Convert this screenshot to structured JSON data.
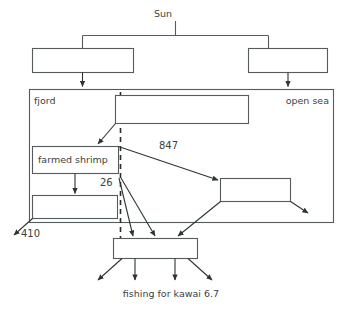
{
  "diagram": {
    "title": "Sun",
    "regions": {
      "left_label": "fjord",
      "right_label": "open sea"
    },
    "nodes": {
      "sun": "Sun",
      "top_left_box": "",
      "top_right_box": "",
      "upper_wide_box": "",
      "farmed_shrimp": "farmed shrimp",
      "lower_left_box": "",
      "right_middle_box": "",
      "bottom_box": ""
    },
    "flow_labels": {
      "to_open_sea": "847",
      "from_shrimp": "26",
      "export_left": "410"
    },
    "caption": "fishing for kawai 6.7",
    "colors": {
      "stroke": "#555a5c",
      "arrow": "#2f3334",
      "dashed": "#2b2b2b",
      "text": "#3b3f41",
      "background": "#ffffff"
    }
  }
}
